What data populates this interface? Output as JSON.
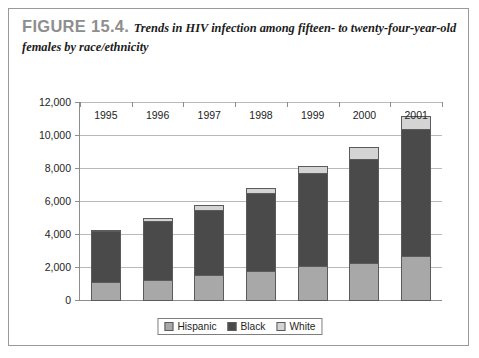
{
  "figure": {
    "label": "FIGURE 15.4.",
    "caption": "Trends in HIV infection among fifteen- to twenty-four-year-old females by race/ethnicity"
  },
  "colors": {
    "hispanic": "#a8a8a8",
    "black": "#4a4a4a",
    "white": "#d4d4d4",
    "gridline": "#b9b9b9",
    "axis": "#8d8d8d",
    "label_gray": "#8e8e8e",
    "border": "#9a9a9a"
  },
  "chart_data": {
    "type": "bar",
    "stacked": true,
    "title": "Trends in HIV infection among fifteen- to twenty-four-year-old females by race/ethnicity",
    "xlabel": "",
    "ylabel": "",
    "categories": [
      "1995",
      "1996",
      "1997",
      "1998",
      "1999",
      "2000",
      "2001"
    ],
    "ylim": [
      0,
      12000
    ],
    "ytick_values": [
      0,
      2000,
      4000,
      6000,
      8000,
      10000,
      12000
    ],
    "ytick_labels": [
      "0",
      "2,000",
      "4,000",
      "6,000",
      "8,000",
      "10,000",
      "12,000"
    ],
    "grid": true,
    "legend_position": "bottom",
    "series": [
      {
        "name": "Hispanic",
        "color": "#a8a8a8",
        "values": [
          1150,
          1300,
          1550,
          1800,
          2100,
          2300,
          2700
        ]
      },
      {
        "name": "Black",
        "color": "#4a4a4a",
        "values": [
          3150,
          3600,
          4050,
          4800,
          5700,
          6350,
          7800
        ]
      },
      {
        "name": "White",
        "color": "#d4d4d4",
        "values": [
          150,
          250,
          350,
          400,
          500,
          800,
          850
        ]
      }
    ],
    "totals": [
      4450,
      5150,
      5950,
      7000,
      8300,
      9450,
      11350
    ]
  }
}
